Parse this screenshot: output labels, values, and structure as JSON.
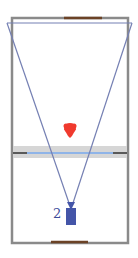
{
  "diagram": {
    "type": "court-camera-view",
    "court": {
      "x": 12,
      "y": 18,
      "width": 116,
      "height": 225,
      "stroke": "#8a8a8a"
    },
    "baselines": {
      "top": {
        "x1": 64,
        "x2": 102,
        "y": 18,
        "color": "#6b4226"
      },
      "bottom": {
        "x1": 51,
        "x2": 88,
        "y": 242,
        "color": "#6b4226"
      }
    },
    "net": {
      "band": {
        "y": 146,
        "height": 12,
        "color": "#d4d4d4"
      },
      "line": {
        "x1": 28,
        "x2": 113,
        "y": 153,
        "color": "#8fb4e8"
      },
      "posts_color": "#5a5a5a"
    },
    "field_of_view": {
      "points": [
        [
          7,
          22
        ],
        [
          132,
          22
        ],
        [
          71,
          205
        ]
      ],
      "color": "#7580b3"
    },
    "ball": {
      "cx": 70,
      "cy": 130,
      "color": "#f03a2e"
    },
    "camera": {
      "label": "2",
      "x": 66,
      "y": 208,
      "width": 10,
      "height": 17,
      "color": "#4455a8"
    }
  }
}
